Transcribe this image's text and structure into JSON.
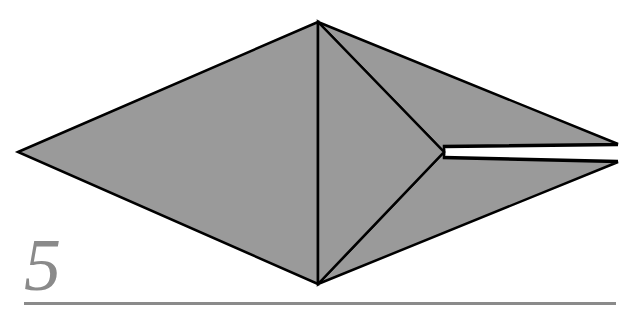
{
  "diagram": {
    "step_number": "5",
    "colors": {
      "paper": "#9a9a9a",
      "edge": "#000000",
      "slit": "#ffffff",
      "step_number": "#8a8a8a",
      "baseline": "#8a8a8a",
      "background": "#ffffff"
    },
    "shapes": {
      "left_diamond_half": {
        "points": [
          [
            18,
            152
          ],
          [
            318,
            22
          ],
          [
            318,
            284
          ]
        ]
      },
      "right_upper_flap": {
        "points": [
          [
            318,
            22
          ],
          [
            618,
            144
          ],
          [
            444,
            148
          ]
        ]
      },
      "right_lower_flap": {
        "points": [
          [
            318,
            284
          ],
          [
            618,
            162
          ],
          [
            444,
            156
          ]
        ]
      },
      "center_triangle": {
        "points": [
          [
            318,
            22
          ],
          [
            444,
            152
          ],
          [
            318,
            284
          ]
        ]
      },
      "slit": {
        "points": [
          [
            444,
            150
          ],
          [
            618,
            146
          ],
          [
            618,
            160
          ],
          [
            444,
            154
          ]
        ]
      }
    },
    "lines": {
      "valley_fold_dashed": {
        "from": [
          318,
          22
        ],
        "to": [
          318,
          284
        ],
        "style": "dashed"
      }
    }
  }
}
